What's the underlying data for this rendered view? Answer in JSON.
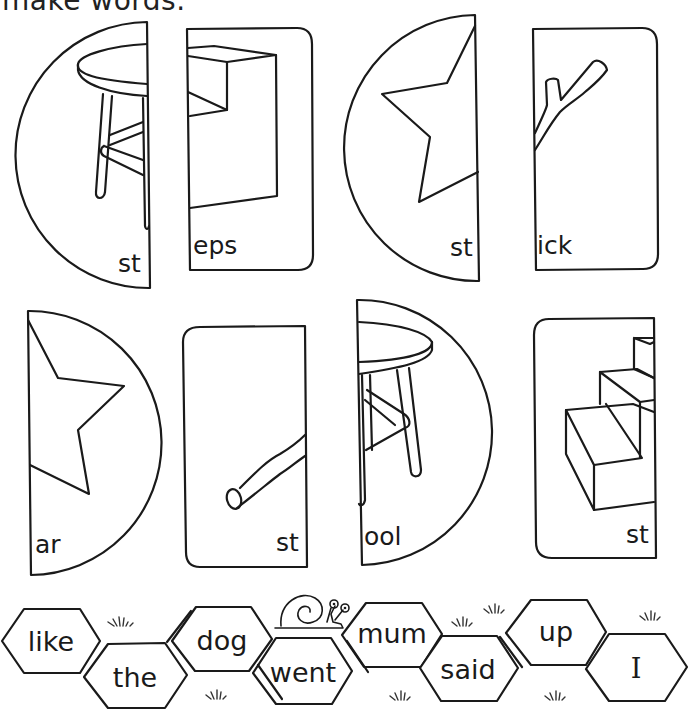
{
  "instruction": "make words.",
  "cards": [
    {
      "id": "card-1",
      "shape": "half-circle-left",
      "picture": "stool-left-half",
      "label": "st"
    },
    {
      "id": "card-2",
      "shape": "rounded-rect-right",
      "picture": "steps-left-half",
      "label": "eps"
    },
    {
      "id": "card-3",
      "shape": "half-circle-left",
      "picture": "star-left-half",
      "label": "st"
    },
    {
      "id": "card-4",
      "shape": "rounded-rect-right",
      "picture": "stick-left-half",
      "label": "ick"
    },
    {
      "id": "card-5",
      "shape": "half-circle-right",
      "picture": "star-right-half",
      "label": "ar"
    },
    {
      "id": "card-6",
      "shape": "rounded-rect-left",
      "picture": "stick-right-half",
      "label": "st"
    },
    {
      "id": "card-7",
      "shape": "half-circle-right",
      "picture": "stool-right-half",
      "label": "ool"
    },
    {
      "id": "card-8",
      "shape": "rounded-rect-left",
      "picture": "steps-right-half",
      "label": "st"
    }
  ],
  "hexagons": [
    {
      "word": "like"
    },
    {
      "word": "the"
    },
    {
      "word": "dog"
    },
    {
      "word": "went"
    },
    {
      "word": "mum"
    },
    {
      "word": "said"
    },
    {
      "word": "up"
    },
    {
      "word": "I"
    }
  ],
  "decorations": {
    "snail": "snail-icon",
    "grass_tufts": 7
  }
}
